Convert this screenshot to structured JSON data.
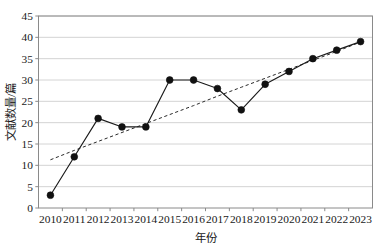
{
  "chart_data": {
    "type": "line",
    "title": "",
    "xlabel": "年份",
    "ylabel": "文献数量/篇",
    "x": [
      2010,
      2011,
      2012,
      2013,
      2014,
      2015,
      2016,
      2017,
      2018,
      2019,
      2020,
      2021,
      2022,
      2023
    ],
    "xtick_labels": [
      "2010",
      "2011",
      "2012",
      "2013",
      "2014",
      "2015",
      "2016",
      "2017",
      "2018",
      "2019",
      "2020",
      "2021",
      "2022",
      "2023"
    ],
    "ytick_labels": [
      "0",
      "5",
      "10",
      "15",
      "20",
      "25",
      "30",
      "35",
      "40",
      "45"
    ],
    "yticks": [
      0,
      5,
      10,
      15,
      20,
      25,
      30,
      35,
      40,
      45
    ],
    "ylim": [
      0,
      45
    ],
    "grid": "horizontal",
    "legend": "none",
    "series": [
      {
        "name": "文献数量",
        "style": "solid-with-markers",
        "marker": "filled-circle",
        "color": "#1a1a1a",
        "values": [
          3,
          12,
          21,
          19,
          19,
          30,
          30,
          28,
          23,
          29,
          32,
          35,
          37,
          39
        ]
      },
      {
        "name": "线性趋势线",
        "style": "dashed",
        "marker": "none",
        "color": "#2a2a2a",
        "values": [
          11.3,
          13.5,
          15.6,
          17.7,
          19.8,
          21.9,
          24.0,
          26.2,
          28.3,
          30.4,
          32.5,
          34.6,
          36.7,
          38.9
        ]
      }
    ],
    "colors": {
      "line": "#1a1a1a",
      "marker": "#111111",
      "trend": "#2a2a2a",
      "grid": "#cfcfcf",
      "axis": "#8a8a8a",
      "background": "#ffffff"
    }
  },
  "caption": {
    "clipped_text": ""
  }
}
